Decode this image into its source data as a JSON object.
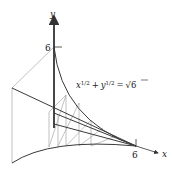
{
  "figure": {
    "axes": {
      "x_label": "x",
      "y_label": "y",
      "x_tick": "6",
      "y_tick": "6"
    },
    "equation": {
      "x_term": "x",
      "x_exp": "1/2",
      "plus": "+",
      "y_term": "y",
      "y_exp": "1/2",
      "equals": "=",
      "sqrt_symbol": "√",
      "rhs": "6"
    },
    "colors": {
      "dark_line": "#3a3a3a",
      "light_line": "#9a9a9a",
      "background": "#ffffff"
    }
  }
}
